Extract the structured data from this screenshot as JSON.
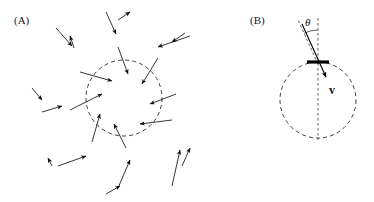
{
  "figure": {
    "width": 374,
    "height": 202,
    "background": "#ffffff",
    "ink_color": "#111111"
  },
  "panels": [
    {
      "id": "panel-a",
      "label": "(A)",
      "label_x": 14,
      "label_y": 24,
      "description": "Randomly oriented arrows converging inward toward a dashed circular boundary"
    },
    {
      "id": "panel-b",
      "label": "(B)",
      "label_x": 250,
      "label_y": 24,
      "description": "Dashed circle with a tangent bar at the top, an inward velocity vector and the incidence angle theta"
    }
  ],
  "panel_a": {
    "circle": {
      "cx": 124,
      "cy": 98,
      "r": 38
    },
    "arrows": [
      {
        "x1": 56,
        "y1": 28,
        "x2": 72,
        "y2": 46
      },
      {
        "x1": 74,
        "y1": 48,
        "x2": 70,
        "y2": 36
      },
      {
        "x1": 118,
        "y1": 20,
        "x2": 130,
        "y2": 12
      },
      {
        "x1": 106,
        "y1": 12,
        "x2": 116,
        "y2": 34
      },
      {
        "x1": 190,
        "y1": 36,
        "x2": 158,
        "y2": 47
      },
      {
        "x1": 185,
        "y1": 33,
        "x2": 172,
        "y2": 42
      },
      {
        "x1": 80,
        "y1": 72,
        "x2": 112,
        "y2": 81
      },
      {
        "x1": 118,
        "y1": 47,
        "x2": 128,
        "y2": 74
      },
      {
        "x1": 158,
        "y1": 58,
        "x2": 142,
        "y2": 84
      },
      {
        "x1": 32,
        "y1": 88,
        "x2": 42,
        "y2": 100
      },
      {
        "x1": 42,
        "y1": 112,
        "x2": 62,
        "y2": 106
      },
      {
        "x1": 70,
        "y1": 110,
        "x2": 102,
        "y2": 94
      },
      {
        "x1": 176,
        "y1": 94,
        "x2": 150,
        "y2": 104
      },
      {
        "x1": 172,
        "y1": 120,
        "x2": 140,
        "y2": 124
      },
      {
        "x1": 92,
        "y1": 142,
        "x2": 100,
        "y2": 114
      },
      {
        "x1": 126,
        "y1": 148,
        "x2": 114,
        "y2": 124
      },
      {
        "x1": 52,
        "y1": 166,
        "x2": 48,
        "y2": 158
      },
      {
        "x1": 58,
        "y1": 166,
        "x2": 86,
        "y2": 156
      },
      {
        "x1": 106,
        "y1": 194,
        "x2": 120,
        "y2": 186
      },
      {
        "x1": 118,
        "y1": 188,
        "x2": 130,
        "y2": 160
      },
      {
        "x1": 172,
        "y1": 186,
        "x2": 180,
        "y2": 150
      },
      {
        "x1": 182,
        "y1": 166,
        "x2": 190,
        "y2": 148
      }
    ]
  },
  "panel_b": {
    "circle": {
      "cx": 318,
      "cy": 100,
      "r": 38
    },
    "vertical_guide": {
      "x": 318,
      "y1": 18,
      "y2": 140
    },
    "tilt_guide": {
      "x1": 318,
      "y1": 62,
      "x2": 300,
      "y2": 22
    },
    "angle_arc": {
      "radius": 32,
      "start_deg": -90,
      "end_deg": -66
    },
    "angle_label": "θ",
    "angle_label_x": 305,
    "angle_label_y": 26,
    "tangent_bar": {
      "x1": 307,
      "y1": 62,
      "x2": 329,
      "y2": 62
    },
    "velocity_vector": {
      "x1": 302,
      "y1": 24,
      "x2": 327,
      "y2": 79
    },
    "velocity_label": "v",
    "velocity_label_x": 329,
    "velocity_label_y": 94
  }
}
